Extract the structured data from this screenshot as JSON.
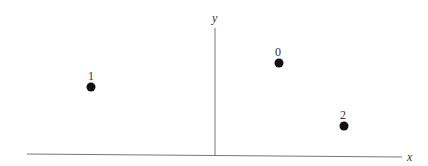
{
  "diagram": {
    "type": "coordinate-plane",
    "axes": {
      "x": {
        "label": "x",
        "x1": 27,
        "y1": 154,
        "x2": 402,
        "y2": 157,
        "label_x": 407,
        "label_y": 161
      },
      "y": {
        "label": "y",
        "x1": 215,
        "y1": 28,
        "x2": 215,
        "y2": 155,
        "label_x": 212,
        "label_y": 22
      },
      "color": "#777777"
    },
    "points": [
      {
        "label": "0",
        "cx": 279,
        "cy": 63,
        "label_x": 275,
        "label_y": 56
      },
      {
        "label": "1",
        "cx": 91,
        "cy": 87,
        "label_x": 88,
        "label_y": 80
      },
      {
        "label": "2",
        "cx": 344,
        "cy": 126,
        "label_x": 340,
        "label_y": 119
      }
    ],
    "point_color": "#111111",
    "point_radius": 4.5
  },
  "chart_data": {
    "type": "scatter",
    "title": "",
    "xlabel": "x",
    "ylabel": "y",
    "grid": false,
    "points": [
      {
        "label": "0",
        "x": 0.34,
        "y": 0.72
      },
      {
        "label": "1",
        "x": -0.67,
        "y": 0.54
      },
      {
        "label": "2",
        "x": 0.69,
        "y": 0.23
      }
    ]
  }
}
